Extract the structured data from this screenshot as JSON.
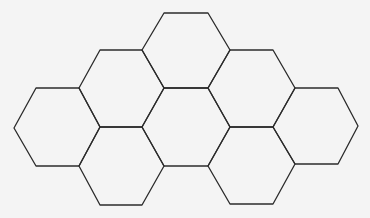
{
  "diagram": {
    "type": "hexagon-tessellation",
    "background": "#f4f4f4",
    "stroke_color": "#2b2b2b",
    "hexagon_count": 8,
    "hexagons": [
      {
        "id": "hex-top",
        "points": "164,13 208,13 230,50 208,88 164,88 142,50"
      },
      {
        "id": "hex-upper-left",
        "points": "100,50 142,50 164,88 142,127 100,127 79,88"
      },
      {
        "id": "hex-upper-right",
        "points": "230,50 273,50 295,88 273,127 230,127 208,88"
      },
      {
        "id": "hex-far-left",
        "points": "36,88 79,88 100,127 79,166 36,166 14,128"
      },
      {
        "id": "hex-center",
        "points": "164,88 208,88 230,127 208,166 164,166 142,127"
      },
      {
        "id": "hex-far-right",
        "points": "295,88 338,88 358,126 338,164 295,164 273,127"
      },
      {
        "id": "hex-lower-left",
        "points": "100,127 142,127 164,166 142,205 100,205 79,166"
      },
      {
        "id": "hex-lower-right",
        "points": "230,127 273,127 295,164 273,204 230,204 208,166"
      }
    ]
  }
}
